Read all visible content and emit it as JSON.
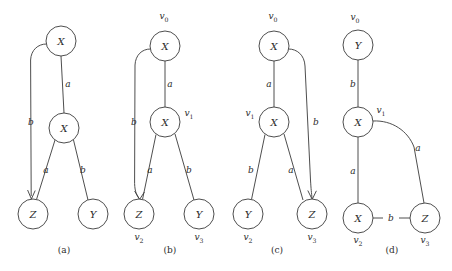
{
  "figure": {
    "background_color": "#ffffff",
    "stroke_color": "#3a3a3a",
    "text_color": "#2b2b2b",
    "panels": [
      {
        "id": "a",
        "caption": "(a)",
        "caption_pos": [
          64,
          250
        ],
        "nodes": [
          {
            "id": "a-n0",
            "label": "X",
            "cx": 61,
            "cy": 41,
            "r": 15,
            "vertex_label": "",
            "vertex_sub": "",
            "vertex_pos": [
              0,
              0
            ]
          },
          {
            "id": "a-n1",
            "label": "X",
            "cx": 64,
            "cy": 128,
            "r": 15,
            "vertex_label": "",
            "vertex_sub": "",
            "vertex_pos": [
              0,
              0
            ]
          },
          {
            "id": "a-n2",
            "label": "Z",
            "cx": 33,
            "cy": 214,
            "r": 15,
            "vertex_label": "",
            "vertex_sub": "",
            "vertex_pos": [
              0,
              0
            ]
          },
          {
            "id": "a-n3",
            "label": "Y",
            "cx": 93,
            "cy": 214,
            "r": 15,
            "vertex_label": "",
            "vertex_sub": "",
            "vertex_pos": [
              0,
              0
            ]
          }
        ],
        "edges": [
          {
            "id": "a-e0",
            "label": "a",
            "label_pos": [
              68,
              84
            ],
            "from": "a-n0",
            "to": "a-n1",
            "kind": "line"
          },
          {
            "id": "a-e1",
            "label": "b",
            "label_pos": [
              31,
              122
            ],
            "from": "a-n0",
            "to": "a-n2",
            "kind": "curve-left"
          },
          {
            "id": "a-e2",
            "label": "a",
            "label_pos": [
              46,
              170
            ],
            "from": "a-n1",
            "to": "a-n2",
            "kind": "line"
          },
          {
            "id": "a-e3",
            "label": "b",
            "label_pos": [
              83,
              170
            ],
            "from": "a-n1",
            "to": "a-n3",
            "kind": "line"
          }
        ]
      },
      {
        "id": "b",
        "caption": "(b)",
        "caption_pos": [
          170,
          250
        ],
        "nodes": [
          {
            "id": "b-n0",
            "label": "X",
            "cx": 165,
            "cy": 46,
            "r": 15,
            "vertex_label": "v",
            "vertex_sub": "0",
            "vertex_pos": [
              164,
              16
            ]
          },
          {
            "id": "b-n1",
            "label": "X",
            "cx": 165,
            "cy": 122,
            "r": 15,
            "vertex_label": "v",
            "vertex_sub": "1",
            "vertex_pos": [
              189,
              113
            ]
          },
          {
            "id": "b-n2",
            "label": "Z",
            "cx": 139,
            "cy": 214,
            "r": 15,
            "vertex_label": "v",
            "vertex_sub": "2",
            "vertex_pos": [
              139,
              237
            ]
          },
          {
            "id": "b-n3",
            "label": "Y",
            "cx": 199,
            "cy": 214,
            "r": 15,
            "vertex_label": "v",
            "vertex_sub": "3",
            "vertex_pos": [
              199,
              237
            ]
          }
        ],
        "edges": [
          {
            "id": "b-e0",
            "label": "a",
            "label_pos": [
              170,
              84
            ],
            "from": "b-n0",
            "to": "b-n1",
            "kind": "line"
          },
          {
            "id": "b-e1",
            "label": "b",
            "label_pos": [
              134,
              122
            ],
            "from": "b-n0",
            "to": "b-n2",
            "kind": "curve-left"
          },
          {
            "id": "b-e2",
            "label": "a",
            "label_pos": [
              150,
              170
            ],
            "from": "b-n1",
            "to": "b-n2",
            "kind": "line"
          },
          {
            "id": "b-e3",
            "label": "b",
            "label_pos": [
              189,
              170
            ],
            "from": "b-n1",
            "to": "b-n3",
            "kind": "line"
          }
        ]
      },
      {
        "id": "c",
        "caption": "(c)",
        "caption_pos": [
          277,
          250
        ],
        "nodes": [
          {
            "id": "c-n0",
            "label": "X",
            "cx": 274,
            "cy": 46,
            "r": 15,
            "vertex_label": "v",
            "vertex_sub": "0",
            "vertex_pos": [
              273,
              16
            ]
          },
          {
            "id": "c-n1",
            "label": "X",
            "cx": 274,
            "cy": 122,
            "r": 15,
            "vertex_label": "v",
            "vertex_sub": "1",
            "vertex_pos": [
              250,
              113
            ]
          },
          {
            "id": "c-n2",
            "label": "Y",
            "cx": 248,
            "cy": 214,
            "r": 15,
            "vertex_label": "v",
            "vertex_sub": "2",
            "vertex_pos": [
              248,
              237
            ]
          },
          {
            "id": "c-n3",
            "label": "Z",
            "cx": 312,
            "cy": 214,
            "r": 15,
            "vertex_label": "v",
            "vertex_sub": "3",
            "vertex_pos": [
              312,
              237
            ]
          }
        ],
        "edges": [
          {
            "id": "c-e0",
            "label": "a",
            "label_pos": [
              269,
              84
            ],
            "from": "c-n0",
            "to": "c-n1",
            "kind": "line"
          },
          {
            "id": "c-e1",
            "label": "b",
            "label_pos": [
              316,
              122
            ],
            "from": "c-n0",
            "to": "c-n3",
            "kind": "curve-right"
          },
          {
            "id": "c-e2",
            "label": "b",
            "label_pos": [
              251,
              170
            ],
            "from": "c-n1",
            "to": "c-n2",
            "kind": "line"
          },
          {
            "id": "c-e3",
            "label": "a",
            "label_pos": [
              291,
              170
            ],
            "from": "c-n1",
            "to": "c-n3",
            "kind": "line"
          }
        ]
      },
      {
        "id": "d",
        "caption": "(d)",
        "caption_pos": [
          392,
          250
        ],
        "nodes": [
          {
            "id": "d-n0",
            "label": "Y",
            "cx": 358,
            "cy": 45,
            "r": 15,
            "vertex_label": "v",
            "vertex_sub": "0",
            "vertex_pos": [
              355,
              17
            ]
          },
          {
            "id": "d-n1",
            "label": "X",
            "cx": 358,
            "cy": 122,
            "r": 15,
            "vertex_label": "v",
            "vertex_sub": "1",
            "vertex_pos": [
              381,
              110
            ]
          },
          {
            "id": "d-n2",
            "label": "X",
            "cx": 358,
            "cy": 218,
            "r": 15,
            "vertex_label": "v",
            "vertex_sub": "2",
            "vertex_pos": [
              358,
              240
            ]
          },
          {
            "id": "d-n3",
            "label": "Z",
            "cx": 425,
            "cy": 218,
            "r": 15,
            "vertex_label": "v",
            "vertex_sub": "3",
            "vertex_pos": [
              425,
              240
            ]
          }
        ],
        "edges": [
          {
            "id": "d-e0",
            "label": "b",
            "label_pos": [
              353,
              84
            ],
            "from": "d-n0",
            "to": "d-n1",
            "kind": "line"
          },
          {
            "id": "d-e1",
            "label": "a",
            "label_pos": [
              353,
              171
            ],
            "from": "d-n1",
            "to": "d-n2",
            "kind": "line"
          },
          {
            "id": "d-e2",
            "label": "a",
            "label_pos": [
              418,
              148
            ],
            "from": "d-n1",
            "to": "d-n3",
            "kind": "curve-right"
          },
          {
            "id": "d-e3",
            "label": "b",
            "label_pos": [
              391,
              218
            ],
            "from": "d-n2",
            "to": "d-n3",
            "kind": "line"
          }
        ]
      }
    ]
  }
}
